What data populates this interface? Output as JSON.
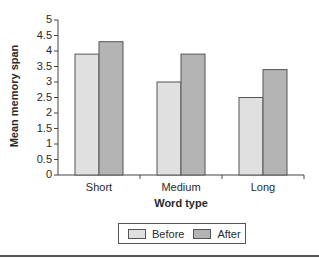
{
  "chart_data": {
    "type": "bar",
    "title": "",
    "xlabel": "Word type",
    "ylabel": "Mean memory span",
    "ylim": [
      0,
      5
    ],
    "yticks": [
      "0",
      "0.5",
      "1",
      "1.5",
      "2",
      "2.5",
      "3",
      "3.5",
      "4",
      "4.5",
      "5"
    ],
    "categories": [
      "Short",
      "Medium",
      "Long"
    ],
    "series": [
      {
        "name": "Before",
        "values": [
          3.9,
          3.0,
          2.5
        ],
        "color": "#e0e0e0"
      },
      {
        "name": "After",
        "values": [
          4.3,
          3.9,
          3.4
        ],
        "color": "#b4b4b4"
      }
    ],
    "grid": false,
    "legend_position": "bottom"
  },
  "legend": {
    "before": "Before",
    "after": "After"
  },
  "axis": {
    "x_title": "Word type",
    "y_title": "Mean memory span"
  }
}
